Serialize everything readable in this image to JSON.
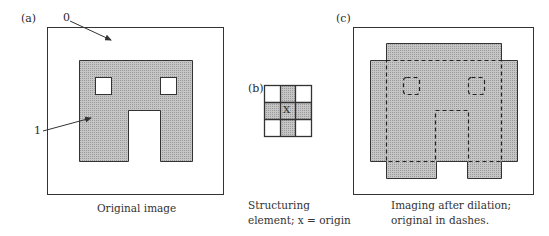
{
  "figure": {
    "panels": [
      {
        "id": "a",
        "tag": "(a)",
        "caption": [
          "Original image"
        ],
        "annotations": [
          {
            "label": "0",
            "meaning": "background pixels"
          },
          {
            "label": "1",
            "meaning": "foreground pixels"
          }
        ]
      },
      {
        "id": "b",
        "tag": "(b)",
        "center_mark": "X",
        "caption": [
          "Structuring",
          "element; x = origin"
        ],
        "grid": [
          [
            0,
            1,
            0
          ],
          [
            1,
            1,
            1
          ],
          [
            0,
            1,
            0
          ]
        ]
      },
      {
        "id": "c",
        "tag": "(c)",
        "caption": [
          "Imaging after dilation;",
          "original in dashes."
        ]
      }
    ],
    "colors": {
      "fill": "#bdbdbd",
      "stroke": "#3a3a3a",
      "background": "#ffffff"
    }
  }
}
